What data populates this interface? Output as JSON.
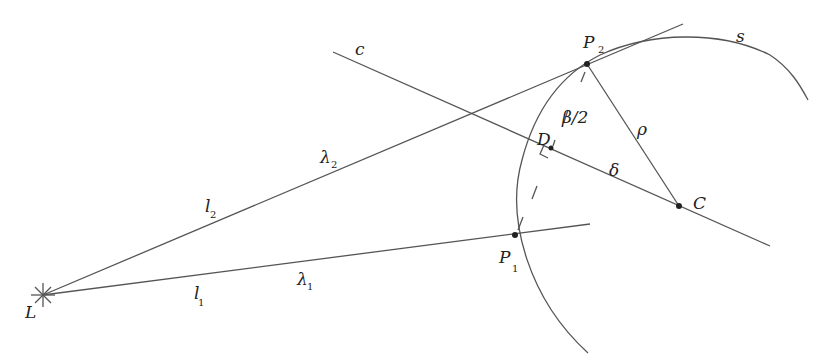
{
  "diagram": {
    "type": "geometric-construction",
    "points": {
      "L": {
        "label": "L",
        "x": 43,
        "y": 295
      },
      "P1": {
        "label": "P",
        "sub": "1",
        "x": 515,
        "y": 235
      },
      "P2": {
        "label": "P",
        "sub": "2",
        "x": 587,
        "y": 64
      },
      "D": {
        "label": "D",
        "x": 551,
        "y": 148
      },
      "C": {
        "label": "C",
        "x": 679,
        "y": 206
      }
    },
    "labels": {
      "c": "c",
      "s": "s",
      "rho": "ρ",
      "delta": "δ",
      "beta_half": "β/2",
      "l2": "l",
      "l2_sub": "2",
      "l1": "l",
      "l1_sub": "1",
      "lambda2": "λ",
      "lambda2_sub": "2",
      "lambda1": "λ",
      "lambda1_sub": "1",
      "P1": "P",
      "P1_sub": "1",
      "P2": "P",
      "P2_sub": "2",
      "D": "D",
      "C": "C",
      "L": "L"
    },
    "colors": {
      "line": "#555555",
      "text": "#222222",
      "background": "#ffffff"
    }
  }
}
